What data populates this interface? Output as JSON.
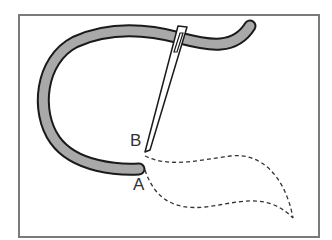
{
  "diagram": {
    "type": "embroidery stitch illustration",
    "labels": {
      "a": "A",
      "b": "B"
    },
    "colors": {
      "thread_fill": "#a9a9a9",
      "outline": "#1a1a1a",
      "frame": "#7a7a7a",
      "background": "#ffffff"
    }
  }
}
